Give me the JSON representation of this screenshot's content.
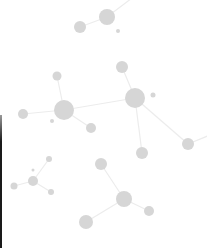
{
  "background": "#ffffff",
  "colors": {
    "node": "#d6d6d6",
    "edge": "#ececec",
    "left_bar": "#1a1a1a"
  },
  "nodes": [
    {
      "id": "A",
      "x": 107,
      "y": 17,
      "r": 8
    },
    {
      "id": "B",
      "x": 80,
      "y": 27,
      "r": 6
    },
    {
      "id": "C",
      "x": 118,
      "y": 31,
      "r": 2
    },
    {
      "id": "A_out",
      "x": 132,
      "y": -2,
      "r": 0
    },
    {
      "id": "D",
      "x": 122,
      "y": 67,
      "r": 6
    },
    {
      "id": "E",
      "x": 135,
      "y": 98,
      "r": 10
    },
    {
      "id": "F",
      "x": 153,
      "y": 95,
      "r": 2.5
    },
    {
      "id": "G",
      "x": 64,
      "y": 110,
      "r": 10
    },
    {
      "id": "H",
      "x": 57,
      "y": 76,
      "r": 4.5
    },
    {
      "id": "I",
      "x": 23,
      "y": 114,
      "r": 5
    },
    {
      "id": "J",
      "x": 52,
      "y": 121,
      "r": 2
    },
    {
      "id": "K",
      "x": 91,
      "y": 128,
      "r": 5
    },
    {
      "id": "L",
      "x": 142,
      "y": 153,
      "r": 6
    },
    {
      "id": "M",
      "x": 188,
      "y": 144,
      "r": 6
    },
    {
      "id": "M_out",
      "x": 210,
      "y": 135,
      "r": 0
    },
    {
      "id": "N",
      "x": 33,
      "y": 181,
      "r": 5
    },
    {
      "id": "O",
      "x": 49,
      "y": 159,
      "r": 3
    },
    {
      "id": "P",
      "x": 33,
      "y": 170,
      "r": 1.5
    },
    {
      "id": "Q",
      "x": 14,
      "y": 186,
      "r": 3.5
    },
    {
      "id": "R",
      "x": 51,
      "y": 192,
      "r": 3
    },
    {
      "id": "S",
      "x": 101,
      "y": 164,
      "r": 6
    },
    {
      "id": "T",
      "x": 124,
      "y": 199,
      "r": 8
    },
    {
      "id": "U",
      "x": 149,
      "y": 211,
      "r": 5
    },
    {
      "id": "V",
      "x": 86,
      "y": 222,
      "r": 7
    }
  ],
  "edges": [
    [
      "B",
      "A"
    ],
    [
      "A",
      "A_out"
    ],
    [
      "D",
      "E"
    ],
    [
      "E",
      "G"
    ],
    [
      "E",
      "L"
    ],
    [
      "E",
      "M"
    ],
    [
      "M",
      "M_out"
    ],
    [
      "G",
      "H"
    ],
    [
      "G",
      "I"
    ],
    [
      "G",
      "K"
    ],
    [
      "N",
      "O"
    ],
    [
      "N",
      "Q"
    ],
    [
      "N",
      "R"
    ],
    [
      "S",
      "T"
    ],
    [
      "T",
      "U"
    ],
    [
      "T",
      "V"
    ]
  ]
}
